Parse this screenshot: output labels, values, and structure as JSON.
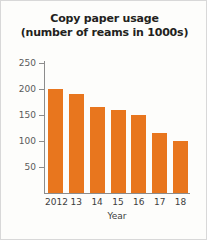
{
  "figure": {
    "background_color": "#fdfdfb",
    "border_color": "#d8d8d8"
  },
  "chart_data": {
    "type": "bar",
    "title": "Copy paper usage",
    "subtitle": "(number of reams in 1000s)",
    "categories": [
      "2012",
      "13",
      "14",
      "15",
      "16",
      "17",
      "18"
    ],
    "values": [
      200,
      190,
      165,
      160,
      150,
      115,
      100
    ],
    "xlabel": "Year",
    "ylabel": "",
    "ylim": [
      0,
      250
    ],
    "yticks": [
      50,
      100,
      150,
      200,
      250
    ],
    "ytick_labels": [
      "50",
      "100",
      "150",
      "200",
      "250"
    ],
    "grid": false,
    "legend": false,
    "bar_color": "#e8761e",
    "axis_color": "#8c8c8c"
  }
}
